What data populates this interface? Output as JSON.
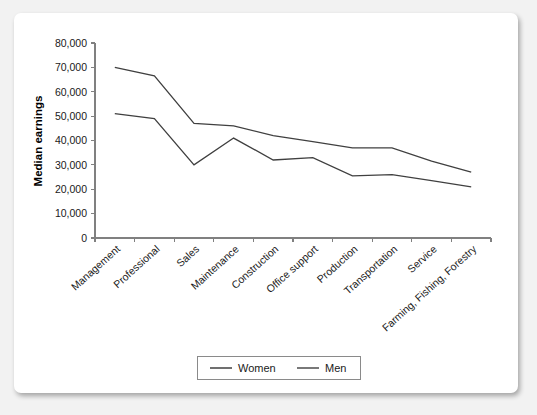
{
  "chart_data": {
    "type": "line",
    "title": "",
    "xlabel": "",
    "ylabel": "Median earnings",
    "ylim": [
      0,
      80000
    ],
    "ytick_labels": [
      "80,000",
      "70,000",
      "60,000",
      "50,000",
      "40,000",
      "30,000",
      "20,000",
      "10,000",
      "0"
    ],
    "ytick_values": [
      80000,
      70000,
      60000,
      50000,
      40000,
      30000,
      20000,
      10000,
      0
    ],
    "grid": false,
    "legend_position": "bottom-center",
    "categories": [
      "Management",
      "Professional",
      "Sales",
      "Maintenance",
      "Construction",
      "Office support",
      "Production",
      "Transportation",
      "Service",
      "Farming, Fishing, Forestry"
    ],
    "series": [
      {
        "name": "Women",
        "color": "#404040",
        "values": [
          51000,
          49000,
          30000,
          41000,
          32000,
          33000,
          25500,
          26000,
          23500,
          21000
        ]
      },
      {
        "name": "Men",
        "color": "#404040",
        "values": [
          70000,
          66500,
          47000,
          46000,
          42000,
          39500,
          37000,
          37000,
          31500,
          27000
        ]
      }
    ]
  },
  "legend": {
    "items": [
      {
        "label": "Women"
      },
      {
        "label": "Men"
      }
    ]
  },
  "colors": {
    "page_background": "#f2f2f2",
    "card_background": "#ffffff",
    "axis": "#808080",
    "text": "#1a1a1a",
    "line": "#404040"
  }
}
